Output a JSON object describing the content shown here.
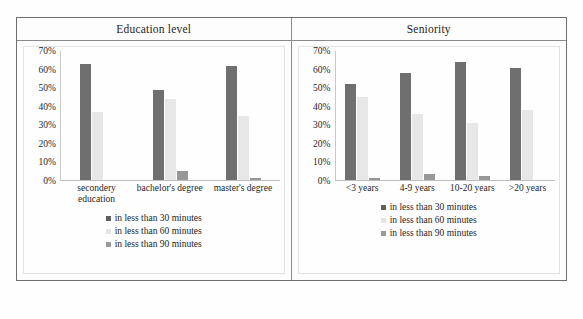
{
  "figure": {
    "columns": [
      {
        "header": "Education level"
      },
      {
        "header": "Seniority"
      }
    ]
  },
  "legend": {
    "items": [
      {
        "label": "in less than 30 minutes",
        "color": "#5f5f5f",
        "icon": "legend-square-icon"
      },
      {
        "label": "in less than 60 minutes",
        "color": "#e3e3e3",
        "icon": "legend-square-icon"
      },
      {
        "label": "in less than 90 minutes",
        "color": "#9a9a9a",
        "icon": "legend-square-icon"
      }
    ]
  },
  "axis": {
    "yticks": [
      "70%",
      "60%",
      "50%",
      "40%",
      "30%",
      "20%",
      "10%",
      "0%"
    ]
  },
  "chart_data": [
    {
      "type": "bar",
      "title": "Education level",
      "xlabel": "",
      "ylabel": "",
      "ylim": [
        0,
        70
      ],
      "ytick_values": [
        0,
        10,
        20,
        30,
        40,
        50,
        60,
        70
      ],
      "ytick_labels": [
        "0%",
        "10%",
        "20%",
        "30%",
        "40%",
        "50%",
        "60%",
        "70%"
      ],
      "grid": false,
      "legend_position": "bottom-center",
      "categories": [
        "secondery education",
        "bachelor's degree",
        "master's degree"
      ],
      "series": [
        {
          "name": "in less than 30 minutes",
          "color": "#6f6f6f",
          "values": [
            63,
            49,
            62
          ]
        },
        {
          "name": "in less than 60 minutes",
          "color": "#e7e7e7",
          "values": [
            37,
            44,
            35
          ]
        },
        {
          "name": "in less than 90 minutes",
          "color": "#979797",
          "values": [
            0,
            5,
            1
          ]
        }
      ]
    },
    {
      "type": "bar",
      "title": "Seniority",
      "xlabel": "",
      "ylabel": "",
      "ylim": [
        0,
        70
      ],
      "ytick_values": [
        0,
        10,
        20,
        30,
        40,
        50,
        60,
        70
      ],
      "ytick_labels": [
        "0%",
        "10%",
        "20%",
        "30%",
        "40%",
        "50%",
        "60%",
        "70%"
      ],
      "grid": false,
      "legend_position": "bottom-center",
      "categories": [
        "<3 years",
        "4-9 years",
        "10-20 years",
        ">20 years"
      ],
      "series": [
        {
          "name": "in less than 30 minutes",
          "color": "#6f6f6f",
          "values": [
            52,
            58,
            64,
            61
          ]
        },
        {
          "name": "in less than 60 minutes",
          "color": "#e7e7e7",
          "values": [
            45,
            36,
            31,
            38
          ]
        },
        {
          "name": "in less than 90 minutes",
          "color": "#979797",
          "values": [
            1,
            3,
            2,
            0
          ]
        }
      ]
    }
  ]
}
